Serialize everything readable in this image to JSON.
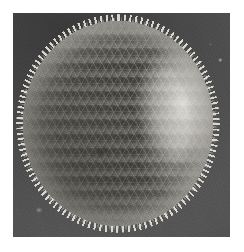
{
  "image": {
    "kind": "sem-micrograph",
    "subject": "spherical microfossil with hexagonally perforated spiny shell",
    "color_mode": "grayscale",
    "caption": "",
    "frame": {
      "canvas_width": 244,
      "canvas_height": 252,
      "margin_color": "#ffffff",
      "plate_left": 13,
      "plate_top": 13,
      "plate_width": 217,
      "plate_height": 224
    },
    "background": {
      "label": "dark substrate",
      "color_dark": "#3a3a3a",
      "color_light": "#555555",
      "debris_specks": [
        {
          "name": "speck-lower-left",
          "x_pct": 18,
          "y_pct": 82,
          "tone": "#cdcbc4"
        },
        {
          "name": "speck-upper-right",
          "x_pct": 95,
          "y_pct": 21,
          "tone": "#dcdad4"
        }
      ]
    },
    "specimen": {
      "label": "perforated sphere",
      "shape": "sphere",
      "left": 10,
      "top": 8,
      "width": 190,
      "height": 205,
      "highlight_color": "#e8e6de",
      "midtone_color": "#cfcdc4",
      "shadow_color": "#8d8b83",
      "pore_color": "#3e3c38",
      "pore_lattice": "hexagonal",
      "pore_spacing_px": 8.2,
      "pore_diameter_px": 5,
      "rim_spines": "radial bristles around entire circumference",
      "specular_patch": "right flank, smooth foreshortened area",
      "defocus_region": "left limb",
      "terminator": "lower-left"
    }
  }
}
